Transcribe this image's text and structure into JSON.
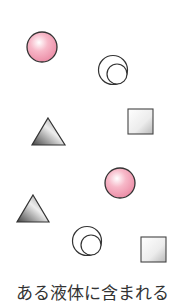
{
  "caption": "ある液体に含まれる",
  "colors": {
    "pink_particle": "#f4a3b8",
    "outline": "#333333",
    "gray_dark": "#555555",
    "gray_light": "#f2f2f2"
  },
  "particles": [
    {
      "type": "pink-sphere",
      "x": 42,
      "y": 47
    },
    {
      "type": "double-circle",
      "x": 113,
      "y": 70
    },
    {
      "type": "triangle",
      "x": 48,
      "y": 132
    },
    {
      "type": "square",
      "x": 140,
      "y": 121
    },
    {
      "type": "pink-sphere",
      "x": 120,
      "y": 183
    },
    {
      "type": "triangle",
      "x": 33,
      "y": 209
    },
    {
      "type": "double-circle",
      "x": 87,
      "y": 241
    },
    {
      "type": "square",
      "x": 153,
      "y": 249
    }
  ]
}
